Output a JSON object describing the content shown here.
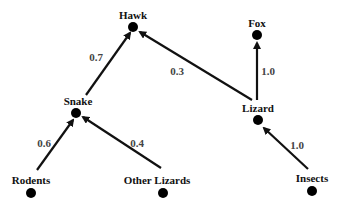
{
  "diagram": {
    "type": "food-web",
    "nodes": [
      {
        "id": "hawk",
        "label": "Hawk",
        "x": 133,
        "y": 27,
        "lx": 133,
        "ly": 15
      },
      {
        "id": "fox",
        "label": "Fox",
        "x": 257,
        "y": 35,
        "lx": 257,
        "ly": 23
      },
      {
        "id": "snake",
        "label": "Snake",
        "x": 76,
        "y": 113,
        "lx": 78,
        "ly": 101
      },
      {
        "id": "lizard",
        "label": "Lizard",
        "x": 258,
        "y": 120,
        "lx": 258,
        "ly": 108
      },
      {
        "id": "rodents",
        "label": "Rodents",
        "x": 31,
        "y": 193,
        "lx": 31,
        "ly": 180
      },
      {
        "id": "other_lizards",
        "label": "Other Lizards",
        "x": 163,
        "y": 193,
        "lx": 157,
        "ly": 180
      },
      {
        "id": "insects",
        "label": "Insects",
        "x": 312,
        "y": 191,
        "lx": 312,
        "ly": 178
      }
    ],
    "edges": [
      {
        "from": "snake",
        "to": "hawk",
        "weight": "0.7",
        "x1": 86,
        "y1": 95,
        "x2": 130,
        "y2": 33,
        "wx": 96,
        "wy": 57
      },
      {
        "from": "lizard",
        "to": "hawk",
        "weight": "0.3",
        "x1": 252,
        "y1": 100,
        "x2": 140,
        "y2": 32,
        "wx": 177,
        "wy": 71
      },
      {
        "from": "lizard",
        "to": "fox",
        "weight": "1.0",
        "x1": 257,
        "y1": 100,
        "x2": 257,
        "y2": 43,
        "wx": 268,
        "wy": 71
      },
      {
        "from": "rodents",
        "to": "snake",
        "weight": "0.6",
        "x1": 37,
        "y1": 170,
        "x2": 73,
        "y2": 120,
        "wx": 44,
        "wy": 143
      },
      {
        "from": "other_lizards",
        "to": "snake",
        "weight": "0.4",
        "x1": 161,
        "y1": 168,
        "x2": 83,
        "y2": 117,
        "wx": 137,
        "wy": 143
      },
      {
        "from": "insects",
        "to": "lizard",
        "weight": "1.0",
        "x1": 308,
        "y1": 169,
        "x2": 264,
        "y2": 128,
        "wx": 297,
        "wy": 145
      }
    ]
  }
}
